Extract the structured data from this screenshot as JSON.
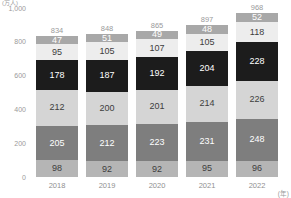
{
  "axis": {
    "y_unit": "(万人)",
    "x_unit": "(年)",
    "y_ticks": [
      "1,000",
      "800",
      "600",
      "400",
      "200",
      "0"
    ]
  },
  "chart_data": {
    "type": "bar",
    "subtype": "stacked",
    "title": "",
    "xlabel": "(年)",
    "ylabel": "(万人)",
    "ylim": [
      0,
      1000
    ],
    "ytick_values": [
      1000,
      800,
      600,
      400,
      200,
      0
    ],
    "ytick_labels": [
      "1,000",
      "800",
      "600",
      "400",
      "200",
      "0"
    ],
    "grid": false,
    "legend": "none",
    "categories": [
      "2018",
      "2019",
      "2020",
      "2021",
      "2022"
    ],
    "totals": [
      834,
      848,
      865,
      897,
      968
    ],
    "stack_order_top_to_bottom": [
      "s6",
      "s5",
      "s4",
      "s3",
      "s2",
      "s1"
    ],
    "series": [
      {
        "name": "s1",
        "values": [
          98,
          92,
          92,
          95,
          96
        ],
        "color": "#b5b5b5",
        "text_color": "#3d3d3d"
      },
      {
        "name": "s2",
        "values": [
          205,
          212,
          223,
          231,
          248
        ],
        "color": "#7e7e7e",
        "text_color": "#ffffff"
      },
      {
        "name": "s3",
        "values": [
          212,
          200,
          201,
          214,
          226
        ],
        "color": "#d5d5d5",
        "text_color": "#3d3d3d"
      },
      {
        "name": "s4",
        "values": [
          178,
          187,
          192,
          204,
          228
        ],
        "color": "#1c1c1c",
        "text_color": "#ffffff"
      },
      {
        "name": "s5",
        "values": [
          95,
          105,
          107,
          105,
          118
        ],
        "color": "#ededed",
        "text_color": "#3d3d3d"
      },
      {
        "name": "s6",
        "values": [
          47,
          51,
          49,
          48,
          52
        ],
        "color": "#a8a8a8",
        "text_color": "#ffffff"
      }
    ]
  },
  "colors": {
    "background": "#ffffff",
    "axis_text": "#9a9a9a",
    "label_dark": "#3d3d3d",
    "label_light": "#ffffff"
  }
}
